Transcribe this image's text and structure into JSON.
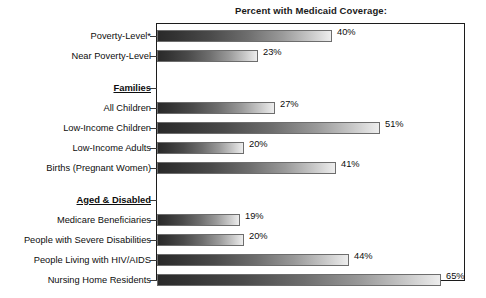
{
  "chart_data": {
    "type": "bar",
    "orientation": "horizontal",
    "title": "Percent with Medicaid Coverage:",
    "xlabel": "",
    "ylabel": "",
    "xlim": [
      0,
      70
    ],
    "grid": false,
    "legend": null,
    "value_suffix": "%",
    "groups": [
      {
        "heading": null,
        "rows": [
          {
            "label": "Poverty-Level*",
            "value": 40,
            "value_label": "40%"
          },
          {
            "label": "Near Poverty-Level",
            "value": 23,
            "value_label": "23%"
          }
        ]
      },
      {
        "heading": "Families",
        "rows": [
          {
            "label": "All Children",
            "value": 27,
            "value_label": "27%"
          },
          {
            "label": "Low-Income Children",
            "value": 51,
            "value_label": "51%"
          },
          {
            "label": "Low-Income Adults",
            "value": 20,
            "value_label": "20%"
          },
          {
            "label": "Births (Pregnant Women)",
            "value": 41,
            "value_label": "41%"
          }
        ]
      },
      {
        "heading": "Aged & Disabled",
        "rows": [
          {
            "label": "Medicare Beneficiaries",
            "value": 19,
            "value_label": "19%"
          },
          {
            "label": "People with Severe Disabilities",
            "value": 20,
            "value_label": "20%"
          },
          {
            "label": "People Living with HIV/AIDS",
            "value": 44,
            "value_label": "44%"
          },
          {
            "label": "Nursing Home Residents",
            "value": 65,
            "value_label": "65%"
          }
        ]
      }
    ],
    "categories": [
      "Poverty-Level*",
      "Near Poverty-Level",
      "All Children",
      "Low-Income Children",
      "Low-Income Adults",
      "Births (Pregnant Women)",
      "Medicare Beneficiaries",
      "People with Severe Disabilities",
      "People Living with HIV/AIDS",
      "Nursing Home Residents"
    ],
    "values": [
      40,
      23,
      27,
      51,
      20,
      41,
      19,
      20,
      44,
      65
    ]
  },
  "footnote": ""
}
